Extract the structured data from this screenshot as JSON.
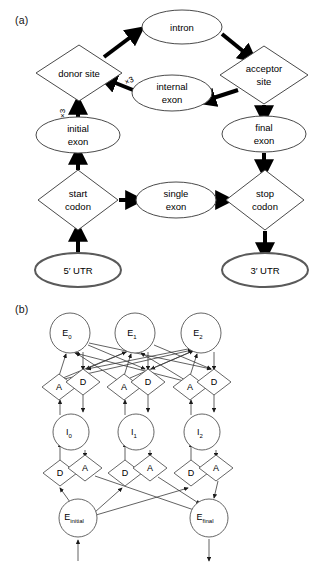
{
  "figure": {
    "panels": [
      {
        "id": "a",
        "label": "(a)"
      },
      {
        "id": "b",
        "label": "(b)"
      }
    ]
  },
  "panel_a": {
    "label": "(a)",
    "nodes": [
      {
        "id": "intron",
        "label": "intron",
        "shape": "ellipse",
        "cx": 182,
        "cy": 27,
        "rx": 40,
        "ry": 17
      },
      {
        "id": "donor_site",
        "label": "donor site",
        "shape": "diamond",
        "cx": 79,
        "cy": 73,
        "rx": 43,
        "ry": 28
      },
      {
        "id": "acceptor_site",
        "label": "acceptor\nsite",
        "label_l1": "acceptor",
        "label_l2": "site",
        "shape": "diamond",
        "cx": 264,
        "cy": 75,
        "rx": 44,
        "ry": 29
      },
      {
        "id": "internal_exon",
        "label": "internal exon",
        "label_l1": "internal",
        "label_l2": "exon",
        "shape": "ellipse",
        "cx": 172,
        "cy": 93,
        "rx": 40,
        "ry": 18
      },
      {
        "id": "initial_exon",
        "label": "initial exon",
        "label_l1": "initial",
        "label_l2": "exon",
        "shape": "ellipse",
        "cx": 78,
        "cy": 135,
        "rx": 42,
        "ry": 18
      },
      {
        "id": "final_exon",
        "label": "final exon",
        "label_l1": "final",
        "label_l2": "exon",
        "shape": "ellipse",
        "cx": 264,
        "cy": 134,
        "rx": 42,
        "ry": 18
      },
      {
        "id": "start_codon",
        "label": "start codon",
        "label_l1": "start",
        "label_l2": "codon",
        "shape": "diamond",
        "cx": 78,
        "cy": 200,
        "rx": 40,
        "ry": 30
      },
      {
        "id": "single_exon",
        "label": "single exon",
        "label_l1": "single",
        "label_l2": "exon",
        "shape": "ellipse",
        "cx": 176,
        "cy": 200,
        "rx": 40,
        "ry": 18
      },
      {
        "id": "stop_codon",
        "label": "stop codon",
        "label_l1": "stop",
        "label_l2": "codon",
        "shape": "diamond",
        "cx": 265,
        "cy": 200,
        "rx": 39,
        "ry": 30
      },
      {
        "id": "utr5",
        "label": "5′ UTR",
        "shape": "ellipse-bold",
        "cx": 78,
        "cy": 270,
        "rx": 43,
        "ry": 17
      },
      {
        "id": "utr3",
        "label": "3′ UTR",
        "shape": "ellipse-bold",
        "cx": 265,
        "cy": 270,
        "rx": 43,
        "ry": 17
      }
    ],
    "edges": [
      {
        "from": "donor_site",
        "to": "intron",
        "label": ""
      },
      {
        "from": "intron",
        "to": "acceptor_site",
        "label": ""
      },
      {
        "from": "acceptor_site",
        "to": "internal_exon",
        "label": ""
      },
      {
        "from": "internal_exon",
        "to": "donor_site",
        "label": "×3"
      },
      {
        "from": "initial_exon",
        "to": "donor_site",
        "label": "×3"
      },
      {
        "from": "acceptor_site",
        "to": "final_exon",
        "label": ""
      },
      {
        "from": "start_codon",
        "to": "initial_exon",
        "label": ""
      },
      {
        "from": "start_codon",
        "to": "single_exon",
        "label": ""
      },
      {
        "from": "single_exon",
        "to": "stop_codon",
        "label": ""
      },
      {
        "from": "final_exon",
        "to": "stop_codon",
        "label": ""
      },
      {
        "from": "utr5",
        "to": "start_codon",
        "label": ""
      },
      {
        "from": "stop_codon",
        "to": "utr3",
        "label": ""
      }
    ],
    "multiplicity_labels": [
      "×3",
      "×3"
    ]
  },
  "panel_b": {
    "label": "(b)",
    "nodes": [
      {
        "id": "E0",
        "base": "E",
        "sub": "0",
        "shape": "circle",
        "cx": 70,
        "cy": 333,
        "r": 20
      },
      {
        "id": "E1",
        "base": "E",
        "sub": "1",
        "shape": "circle",
        "cx": 135,
        "cy": 333,
        "r": 20
      },
      {
        "id": "E2",
        "base": "E",
        "sub": "2",
        "shape": "circle",
        "cx": 201,
        "cy": 333,
        "r": 20
      },
      {
        "id": "A0",
        "base": "A",
        "sub": "",
        "shape": "diamond",
        "cx": 59,
        "cy": 387,
        "rx": 17,
        "ry": 13
      },
      {
        "id": "D0",
        "base": "D",
        "sub": "",
        "shape": "diamond",
        "cx": 83,
        "cy": 382,
        "rx": 17,
        "ry": 13
      },
      {
        "id": "A1",
        "base": "A",
        "sub": "",
        "shape": "diamond",
        "cx": 124,
        "cy": 387,
        "rx": 17,
        "ry": 13
      },
      {
        "id": "D1",
        "base": "D",
        "sub": "",
        "shape": "diamond",
        "cx": 148,
        "cy": 382,
        "rx": 17,
        "ry": 13
      },
      {
        "id": "A2",
        "base": "A",
        "sub": "",
        "shape": "diamond",
        "cx": 190,
        "cy": 387,
        "rx": 17,
        "ry": 13
      },
      {
        "id": "D2",
        "base": "D",
        "sub": "",
        "shape": "diamond",
        "cx": 214,
        "cy": 382,
        "rx": 17,
        "ry": 13
      },
      {
        "id": "I0",
        "base": "I",
        "sub": "0",
        "shape": "circle",
        "cx": 71,
        "cy": 432,
        "r": 18
      },
      {
        "id": "I1",
        "base": "I",
        "sub": "1",
        "shape": "circle",
        "cx": 136,
        "cy": 432,
        "r": 18
      },
      {
        "id": "I2",
        "base": "I",
        "sub": "2",
        "shape": "circle",
        "cx": 202,
        "cy": 432,
        "r": 18
      },
      {
        "id": "D0b",
        "base": "D",
        "sub": "",
        "shape": "diamond",
        "cx": 60,
        "cy": 473,
        "rx": 17,
        "ry": 13
      },
      {
        "id": "A0b",
        "base": "A",
        "sub": "",
        "shape": "diamond",
        "cx": 85,
        "cy": 468,
        "rx": 17,
        "ry": 13
      },
      {
        "id": "D1b",
        "base": "D",
        "sub": "",
        "shape": "diamond",
        "cx": 125,
        "cy": 473,
        "rx": 17,
        "ry": 13
      },
      {
        "id": "A1b",
        "base": "A",
        "sub": "",
        "shape": "diamond",
        "cx": 150,
        "cy": 468,
        "rx": 17,
        "ry": 13
      },
      {
        "id": "D2b",
        "base": "D",
        "sub": "",
        "shape": "diamond",
        "cx": 191,
        "cy": 473,
        "rx": 17,
        "ry": 13
      },
      {
        "id": "A2b",
        "base": "A",
        "sub": "",
        "shape": "diamond",
        "cx": 216,
        "cy": 468,
        "rx": 17,
        "ry": 13
      },
      {
        "id": "Einitial",
        "base": "E",
        "sub": "initial",
        "shape": "circle",
        "cx": 78,
        "cy": 518,
        "r": 19
      },
      {
        "id": "Efinal",
        "base": "E",
        "sub": "final",
        "shape": "circle",
        "cx": 209,
        "cy": 518,
        "r": 19
      }
    ],
    "entry_arrow": {
      "x": 78,
      "y_from": 560,
      "y_to": 540
    },
    "exit_arrow": {
      "x": 209,
      "y_from": 540,
      "y_to": 562
    }
  }
}
